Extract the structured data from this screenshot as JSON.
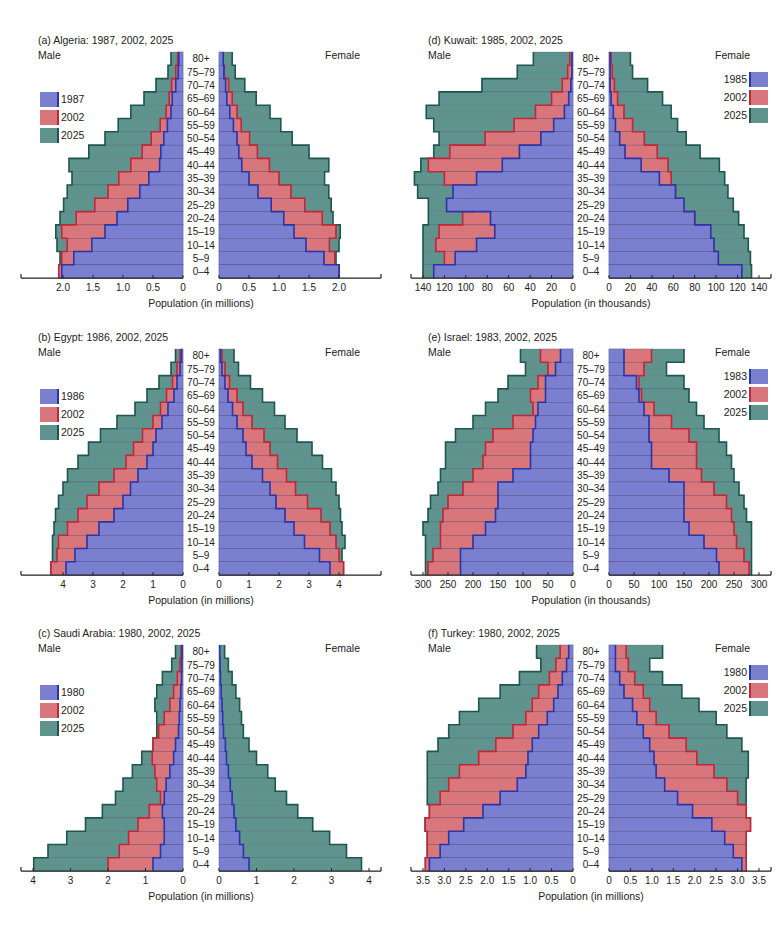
{
  "age_groups": [
    "80+",
    "75–79",
    "70–74",
    "65–69",
    "60–64",
    "55–59",
    "50–54",
    "45–49",
    "40–44",
    "35–39",
    "30–34",
    "25–29",
    "20–24",
    "15–19",
    "10–14",
    "5–9",
    "0–4"
  ],
  "labels": {
    "male": "Male",
    "female": "Female"
  },
  "colors": {
    "early": "#7b7fcf",
    "early_edge": "#2a36a8",
    "mid": "#d9767c",
    "mid_edge": "#c0283a",
    "late": "#5f948e",
    "late_edge": "#1f5650"
  },
  "chart_data": [
    {
      "id": "a",
      "type": "bar",
      "subtype": "population-pyramid",
      "title": "(a)  Algeria: 1987, 2002, 2025",
      "xlabel": "Population (in millions)",
      "unit": "millions",
      "xlim": [
        0,
        2.5
      ],
      "ticks": [
        0,
        0.5,
        1.0,
        1.5,
        2.0
      ],
      "tick_labels": [
        "0",
        "0.5",
        "1.0",
        "1.5",
        "2.0"
      ],
      "legend_position": "left",
      "series": [
        {
          "name": "1987",
          "male": [
            0.07,
            0.08,
            0.12,
            0.18,
            0.2,
            0.26,
            0.32,
            0.37,
            0.39,
            0.57,
            0.72,
            0.92,
            1.1,
            1.3,
            1.52,
            1.82,
            2.02
          ],
          "female": [
            0.07,
            0.08,
            0.11,
            0.13,
            0.18,
            0.24,
            0.3,
            0.33,
            0.38,
            0.5,
            0.65,
            0.87,
            1.08,
            1.25,
            1.45,
            1.75,
            2.0
          ]
        },
        {
          "name": "2002",
          "male": [
            0.09,
            0.12,
            0.19,
            0.23,
            0.28,
            0.38,
            0.53,
            0.68,
            0.87,
            1.07,
            1.25,
            1.47,
            1.78,
            2.02,
            1.93,
            2.02,
            2.07
          ],
          "female": [
            0.07,
            0.09,
            0.16,
            0.22,
            0.3,
            0.37,
            0.51,
            0.64,
            0.84,
            1.0,
            1.2,
            1.43,
            1.72,
            1.95,
            1.84,
            1.93,
            2.0
          ]
        },
        {
          "name": "2025",
          "male": [
            0.2,
            0.25,
            0.45,
            0.65,
            0.87,
            1.08,
            1.3,
            1.57,
            1.9,
            1.85,
            1.93,
            1.99,
            2.05,
            2.12,
            2.1,
            2.05,
            2.07
          ],
          "female": [
            0.22,
            0.27,
            0.43,
            0.62,
            0.85,
            1.03,
            1.22,
            1.5,
            1.83,
            1.76,
            1.83,
            1.87,
            1.9,
            2.02,
            2.0,
            1.95,
            2.0
          ]
        }
      ]
    },
    {
      "id": "b",
      "type": "bar",
      "subtype": "population-pyramid",
      "title": "(b)  Egypt: 1986, 2002, 2025",
      "xlabel": "Population (in millions)",
      "unit": "millions",
      "xlim": [
        0,
        5
      ],
      "ticks": [
        0,
        1,
        2,
        3,
        4
      ],
      "tick_labels": [
        "0",
        "1",
        "2",
        "3",
        "4"
      ],
      "legend_position": "left",
      "series": [
        {
          "name": "1986",
          "male": [
            0.05,
            0.1,
            0.2,
            0.3,
            0.5,
            0.7,
            0.9,
            1.0,
            1.2,
            1.5,
            1.75,
            2.0,
            2.3,
            2.8,
            3.2,
            3.6,
            3.9
          ],
          "female": [
            0.05,
            0.1,
            0.2,
            0.3,
            0.45,
            0.6,
            0.8,
            0.9,
            1.1,
            1.45,
            1.7,
            1.9,
            2.2,
            2.5,
            2.85,
            3.35,
            3.7
          ]
        },
        {
          "name": "2002",
          "male": [
            0.1,
            0.2,
            0.35,
            0.55,
            0.75,
            1.0,
            1.35,
            1.65,
            1.9,
            2.3,
            2.8,
            3.2,
            3.5,
            3.85,
            4.15,
            4.2,
            4.4
          ],
          "female": [
            0.1,
            0.2,
            0.35,
            0.6,
            0.8,
            1.1,
            1.5,
            1.7,
            1.95,
            2.25,
            2.55,
            2.95,
            3.4,
            3.7,
            3.9,
            4.0,
            4.15
          ]
        },
        {
          "name": "2025",
          "male": [
            0.25,
            0.4,
            0.8,
            1.2,
            1.6,
            2.2,
            2.75,
            3.15,
            3.5,
            3.85,
            4.0,
            4.15,
            4.25,
            4.3,
            4.35,
            4.35,
            4.4
          ],
          "female": [
            0.5,
            0.65,
            1.05,
            1.45,
            1.85,
            2.2,
            2.6,
            3.1,
            3.45,
            3.75,
            3.9,
            4.0,
            4.05,
            4.1,
            4.2,
            4.1,
            4.15
          ]
        }
      ]
    },
    {
      "id": "c",
      "type": "bar",
      "subtype": "population-pyramid",
      "title": "(c)  Saudi Arabia: 1980, 2002, 2025",
      "xlabel": "Population (in millions)",
      "unit": "millions",
      "xlim": [
        0,
        4
      ],
      "ticks": [
        0,
        1,
        2,
        3,
        4
      ],
      "tick_labels": [
        "0",
        "1",
        "2",
        "3",
        "4"
      ],
      "legend_position": "left",
      "series": [
        {
          "name": "1980",
          "male": [
            0.02,
            0.03,
            0.04,
            0.06,
            0.08,
            0.1,
            0.12,
            0.2,
            0.25,
            0.35,
            0.45,
            0.5,
            0.55,
            0.5,
            0.5,
            0.6,
            0.8
          ],
          "female": [
            0.02,
            0.03,
            0.04,
            0.06,
            0.08,
            0.1,
            0.12,
            0.17,
            0.2,
            0.25,
            0.3,
            0.35,
            0.4,
            0.45,
            0.55,
            0.65,
            0.8
          ]
        },
        {
          "name": "2002",
          "male": [
            0.05,
            0.08,
            0.15,
            0.25,
            0.35,
            0.5,
            0.65,
            0.8,
            0.82,
            0.75,
            0.7,
            0.6,
            0.9,
            1.2,
            1.45,
            1.7,
            2.0
          ]
        },
        {
          "name": "2025",
          "male": [
            0.2,
            0.3,
            0.55,
            0.7,
            0.75,
            0.7,
            0.7,
            0.8,
            1.1,
            1.35,
            1.6,
            1.8,
            2.15,
            2.6,
            3.1,
            3.6,
            3.98
          ],
          "female": [
            0.15,
            0.25,
            0.35,
            0.45,
            0.55,
            0.6,
            0.65,
            0.8,
            1.0,
            1.3,
            1.5,
            1.8,
            2.1,
            2.5,
            2.95,
            3.4,
            3.8
          ]
        }
      ]
    },
    {
      "id": "d",
      "type": "bar",
      "subtype": "population-pyramid",
      "title": "(d)  Kuwait: 1985, 2002, 2025",
      "xlabel": "Population (in thousands)",
      "unit": "thousands",
      "xlim": [
        0,
        140
      ],
      "ticks": [
        0,
        20,
        40,
        60,
        80,
        100,
        120,
        140
      ],
      "tick_labels": [
        "0",
        "20",
        "40",
        "60",
        "80",
        "100",
        "120",
        "140"
      ],
      "legend_position": "right",
      "series": [
        {
          "name": "1985",
          "male": [
            1,
            1,
            2,
            4,
            8,
            18,
            30,
            50,
            66,
            90,
            112,
            118,
            77,
            73,
            90,
            110,
            130
          ],
          "female": [
            1,
            1,
            1,
            2,
            4,
            6,
            10,
            15,
            30,
            47,
            62,
            70,
            80,
            95,
            98,
            102,
            124
          ]
        },
        {
          "name": "2002",
          "male": [
            3,
            5,
            10,
            20,
            35,
            55,
            82,
            115,
            135,
            120,
            102,
            93,
            103,
            125,
            128,
            120,
            110
          ],
          "female": [
            2,
            3,
            5,
            8,
            14,
            22,
            33,
            45,
            55,
            58,
            62,
            68,
            80,
            94,
            95,
            102,
            104
          ]
        },
        {
          "name": "2025",
          "male": [
            37,
            52,
            85,
            125,
            137,
            130,
            125,
            130,
            142,
            148,
            145,
            135,
            135,
            140,
            140,
            140,
            140
          ],
          "female": [
            20,
            22,
            36,
            50,
            58,
            64,
            72,
            85,
            103,
            108,
            111,
            116,
            121,
            126,
            130,
            132,
            133
          ]
        }
      ]
    },
    {
      "id": "e",
      "type": "bar",
      "subtype": "population-pyramid",
      "title": "(e)  Israel: 1983, 2002, 2025",
      "xlabel": "Population (in thousands)",
      "unit": "thousands",
      "xlim": [
        0,
        300
      ],
      "ticks": [
        0,
        50,
        100,
        150,
        200,
        250,
        300
      ],
      "tick_labels": [
        "0",
        "50",
        "100",
        "150",
        "200",
        "250",
        "300"
      ],
      "legend_position": "right",
      "series": [
        {
          "name": "1983",
          "male": [
            25,
            35,
            55,
            55,
            70,
            75,
            80,
            85,
            85,
            120,
            150,
            150,
            155,
            175,
            200,
            225,
            225
          ],
          "female": [
            30,
            30,
            55,
            60,
            70,
            80,
            80,
            85,
            85,
            120,
            150,
            150,
            150,
            160,
            190,
            215,
            220
          ]
        },
        {
          "name": "2002",
          "male": [
            65,
            50,
            70,
            85,
            80,
            120,
            160,
            175,
            180,
            200,
            220,
            250,
            260,
            265,
            265,
            280,
            290
          ],
          "female": [
            85,
            70,
            60,
            65,
            90,
            125,
            160,
            175,
            175,
            185,
            210,
            235,
            245,
            250,
            255,
            270,
            280
          ]
        },
        {
          "name": "2025",
          "male": [
            105,
            95,
            130,
            150,
            175,
            200,
            235,
            255,
            255,
            265,
            270,
            285,
            290,
            300,
            295,
            295,
            295
          ],
          "female": [
            150,
            115,
            150,
            160,
            175,
            190,
            220,
            235,
            245,
            250,
            260,
            270,
            275,
            285,
            285,
            285,
            285
          ]
        }
      ]
    },
    {
      "id": "f",
      "type": "bar",
      "subtype": "population-pyramid",
      "title": "(f)  Turkey: 1980, 2002, 2025",
      "xlabel": "Population (in millions)",
      "unit": "millions",
      "xlim": [
        0,
        3.5
      ],
      "ticks": [
        0,
        0.5,
        1.0,
        1.5,
        2.0,
        2.5,
        3.0,
        3.5
      ],
      "tick_labels": [
        "0",
        "0.5",
        "1.0",
        "1.5",
        "2.0",
        "2.5",
        "3.0",
        "3.5"
      ],
      "legend_position": "right",
      "series": [
        {
          "name": "1980",
          "male": [
            0.1,
            0.15,
            0.25,
            0.35,
            0.45,
            0.6,
            0.8,
            0.95,
            1.05,
            1.1,
            1.3,
            1.7,
            2.1,
            2.55,
            2.9,
            3.1,
            3.35
          ],
          "female": [
            0.15,
            0.15,
            0.25,
            0.35,
            0.55,
            0.65,
            0.8,
            0.95,
            1.05,
            1.1,
            1.3,
            1.6,
            1.95,
            2.4,
            2.7,
            2.9,
            3.1
          ]
        },
        {
          "name": "2002",
          "male": [
            0.3,
            0.4,
            0.55,
            0.8,
            0.95,
            1.1,
            1.4,
            1.8,
            2.2,
            2.65,
            2.9,
            3.1,
            3.35,
            3.45,
            3.4,
            3.4,
            3.45
          ],
          "female": [
            0.4,
            0.45,
            0.6,
            0.8,
            0.95,
            1.1,
            1.4,
            1.8,
            2.05,
            2.45,
            2.75,
            3.0,
            3.2,
            3.3,
            3.2,
            3.2,
            3.2
          ]
        },
        {
          "name": "2025",
          "male": [
            0.85,
            0.75,
            1.25,
            1.7,
            2.2,
            2.65,
            2.9,
            3.15,
            3.4,
            3.4,
            3.4,
            3.4,
            3.35,
            3.45,
            3.4,
            3.4,
            3.4
          ],
          "female": [
            1.25,
            0.95,
            1.25,
            1.7,
            2.1,
            2.5,
            2.75,
            3.1,
            3.25,
            3.25,
            3.2,
            3.2,
            3.2,
            3.3,
            3.2,
            3.2,
            3.2
          ]
        }
      ]
    }
  ]
}
